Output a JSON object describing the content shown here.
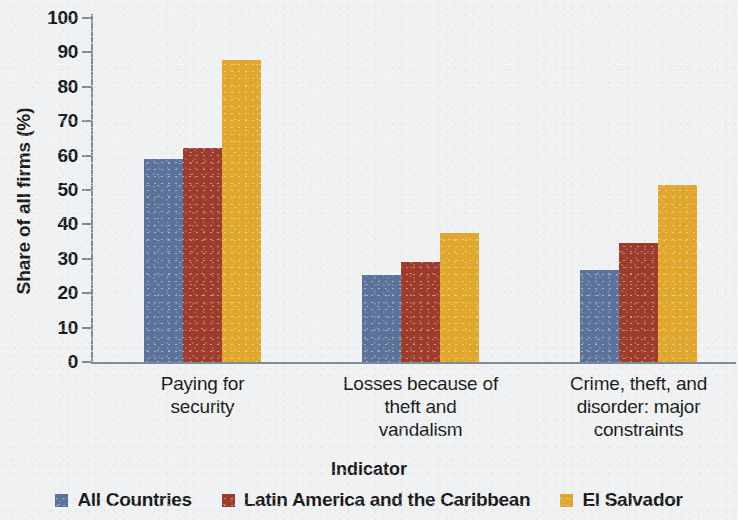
{
  "chart_data": {
    "type": "bar",
    "title": "",
    "xlabel": "Indicator",
    "ylabel": "Share of all firms (%)",
    "ylim": [
      0,
      100
    ],
    "ytick_step": 10,
    "yticks": [
      0,
      10,
      20,
      30,
      40,
      50,
      60,
      70,
      80,
      90,
      100
    ],
    "grid": false,
    "legend_position": "bottom",
    "categories": [
      "Paying for security",
      "Losses because of theft and vandalism",
      "Crime, theft, and disorder: major constraints"
    ],
    "category_lines": [
      [
        "Paying for",
        "security"
      ],
      [
        "Losses because of",
        "theft and",
        "vandalism"
      ],
      [
        "Crime, theft, and",
        "disorder: major",
        "constraints"
      ]
    ],
    "series": [
      {
        "name": "All Countries",
        "color": "#5b729b",
        "values": [
          59.0,
          25.4,
          26.7
        ]
      },
      {
        "name": "Latin America and the Caribbean",
        "color": "#9e3c2c",
        "values": [
          62.2,
          29.0,
          34.6
        ]
      },
      {
        "name": "El Salvador",
        "color": "#e0a72b",
        "values": [
          87.7,
          37.6,
          51.4
        ]
      }
    ]
  },
  "colors": {
    "background": "#eff1f3",
    "axis": "#7d8b99",
    "text": "#1a1a1a",
    "series_all_countries": "#5b729b",
    "series_lac": "#9e3c2c",
    "series_el_salvador": "#e0a72b"
  }
}
